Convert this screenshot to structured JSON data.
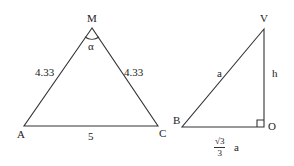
{
  "diagram": {
    "triangle_1": {
      "vertices": {
        "apex": "M",
        "left": "A",
        "right": "C"
      },
      "angle_label": "α",
      "side_labels": {
        "MA": "4.33",
        "MC": "4.33",
        "AC": "5"
      }
    },
    "triangle_2": {
      "vertices": {
        "top": "V",
        "left": "B",
        "right_angle": "O"
      },
      "side_labels": {
        "BV": "a",
        "VO": "h",
        "BO": {
          "numerator": "√3",
          "denominator": "3",
          "suffix": "a"
        }
      }
    },
    "colors": {
      "stroke": "#333333",
      "background": "#ffffff"
    }
  }
}
